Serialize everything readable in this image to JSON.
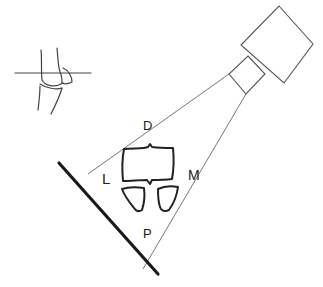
{
  "diagram": {
    "type": "radiographic-projection-schematic",
    "labels": {
      "dorsal": "D",
      "lateral": "L",
      "medial": "M",
      "palmar": "P"
    },
    "components": {
      "inset": "joint-inset-with-reference-line",
      "xray_tube": "x-ray-tube-housing",
      "collimator": "collimator",
      "beam": "x-ray-beam",
      "detector": "detector-plate",
      "bones": [
        "bone-cross-section-main",
        "bone-cross-section-left",
        "bone-cross-section-right"
      ]
    },
    "colors": {
      "line": "#555555",
      "bone": "#222222",
      "detector": "#1a1a1a",
      "background": "#ffffff"
    }
  }
}
